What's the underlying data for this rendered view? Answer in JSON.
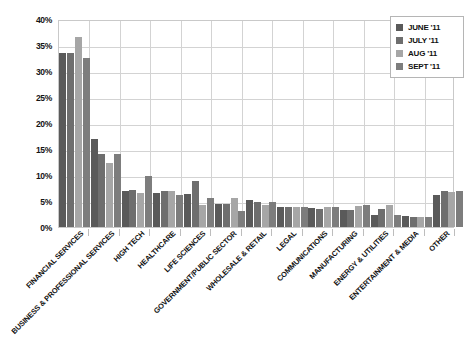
{
  "chart_data": {
    "type": "bar",
    "title": "",
    "subtitle": "",
    "xlabel": "",
    "ylabel": "",
    "ylim": [
      0,
      40
    ],
    "ytick_values": [
      0,
      5,
      10,
      15,
      20,
      25,
      30,
      35,
      40
    ],
    "ytick_labels": [
      "0%",
      "5%",
      "10%",
      "15%",
      "20%",
      "25%",
      "30%",
      "35%",
      "40%"
    ],
    "grid": true,
    "legend_position": "top-right",
    "categories": [
      "FINANCIAL SERVICES",
      "BUSINESS & PROFESSIONAL SERVICES",
      "HIGH TECH",
      "HEALTHCARE",
      "LIFE SCIENCES",
      "GOVERNMENT/PUBLIC SECTOR",
      "WHOLESALE & RETAIL",
      "LEGAL",
      "COMMUNICATIONS",
      "MANUFACTURING",
      "ENERGY & UTILITIES",
      "ENTERTAINMENT & MEDIA",
      "OTHER"
    ],
    "series": [
      {
        "name": "JUNE '11",
        "color": "#5a5a5a",
        "values": [
          33.5,
          17.0,
          7.0,
          6.5,
          6.3,
          4.5,
          5.2,
          3.9,
          3.6,
          3.2,
          2.3,
          2.2,
          6.1
        ]
      },
      {
        "name": "JULY '11",
        "color": "#6e6e6e",
        "values": [
          33.5,
          14.0,
          7.2,
          7.0,
          8.9,
          4.4,
          4.8,
          3.9,
          3.5,
          3.2,
          3.5,
          2.0,
          7.0
        ]
      },
      {
        "name": "AUG '11",
        "color": "#a6a6a6",
        "values": [
          36.5,
          12.3,
          6.6,
          6.9,
          4.3,
          5.6,
          4.2,
          3.8,
          3.8,
          4.0,
          4.3,
          1.9,
          6.8
        ]
      },
      {
        "name": "SEPT '11",
        "color": "#7d7d7d",
        "values": [
          32.5,
          14.0,
          9.9,
          6.2,
          5.6,
          3.0,
          4.9,
          3.8,
          3.9,
          4.2,
          2.4,
          1.9,
          7.0
        ]
      }
    ]
  },
  "legend": {
    "items": [
      {
        "label": "JUNE '11"
      },
      {
        "label": "JULY '11"
      },
      {
        "label": "AUG '11"
      },
      {
        "label": "SEPT '11"
      }
    ]
  },
  "colors": {
    "series_1": "#5a5a5a",
    "series_2": "#6e6e6e",
    "series_3": "#a6a6a6",
    "series_4": "#7d7d7d",
    "grid": "#d3d3d3",
    "axis": "#c9c9c9",
    "text": "#111111",
    "background": "#ffffff"
  }
}
